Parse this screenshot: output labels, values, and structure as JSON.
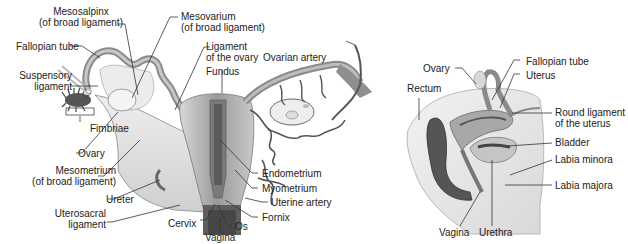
{
  "figure": {
    "left_panel": {
      "name": "uterus-posterior-view",
      "labels": {
        "mesosalpinx": "Mesosalpinx",
        "mesosalpinx_sub": "(of broad ligament)",
        "mesovarium": "Mesovarium",
        "mesovarium_sub": "(of broad ligament)",
        "fallopian_tube": "Fallopian tube",
        "ligament_ovary": "Ligament",
        "ligament_ovary_sub": "of the ovary",
        "fundus": "Fundus",
        "ovarian_artery": "Ovarian artery",
        "suspensory": "Suspensory",
        "suspensory_sub": "ligament",
        "fimbriae": "Fimbriae",
        "ovary": "Ovary",
        "mesometrium": "Mesometrium",
        "mesometrium_sub": "(of broad ligament)",
        "endometrium": "Endometrium",
        "myometrium": "Myometrium",
        "uterine_artery": "Uterine artery",
        "ureter": "Ureter",
        "uterosacral": "Uterosacral",
        "uterosacral_sub": "ligament",
        "fornix": "Fornix",
        "cervix": "Cervix",
        "os": "Os",
        "vagina": "Vagina"
      }
    },
    "right_panel": {
      "name": "pelvis-sagittal-view",
      "labels": {
        "ovary": "Ovary",
        "fallopian_tube": "Fallopian tube",
        "rectum": "Rectum",
        "uterus": "Uterus",
        "round_ligament": "Round ligament",
        "round_ligament_sub": "of the uterus",
        "bladder": "Bladder",
        "labia_minora": "Labia minora",
        "labia_majora": "Labia majora",
        "vagina": "Vagina",
        "urethra": "Urethra"
      }
    },
    "colors": {
      "tissue_light": "#e4e4e4",
      "tissue_mid": "#b8b8b8",
      "tissue_dark": "#6a6a6a",
      "cavity_dark": "#3a3a3a",
      "vessel": "#555555",
      "leader_line": "#333333"
    }
  }
}
